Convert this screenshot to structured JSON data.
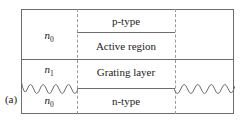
{
  "figure": {
    "part_label": "(a)",
    "layers": [
      {
        "name": "p-type",
        "text": "p-type"
      },
      {
        "name": "active-region",
        "text": "Active region"
      },
      {
        "name": "grating-layer",
        "text": "Grating layer"
      },
      {
        "name": "n-type",
        "text": "n-type"
      }
    ],
    "index_labels": {
      "top": {
        "symbol": "n",
        "subscript": "0"
      },
      "middle": {
        "symbol": "n",
        "subscript": "1"
      },
      "bottom": {
        "symbol": "n",
        "subscript": "0"
      }
    },
    "colors": {
      "solid_line": "#6d6d6d",
      "dashed_line": "#9a9a9a",
      "text": "#1b1b1b",
      "background": "#ffffff"
    },
    "geometry": {
      "outer_box": {
        "x": 21,
        "y": 9,
        "width": 213,
        "height": 105
      },
      "cavity_left_boundary_x": 77,
      "cavity_right_boundary_x": 175,
      "full_divider_y": 59,
      "ptype_active_divider_y": 32,
      "grating_ntype_divider_y": 88,
      "grating_wave_cycles": 4.5
    }
  }
}
